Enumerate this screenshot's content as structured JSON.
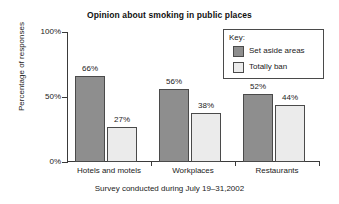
{
  "chart_data": {
    "type": "bar",
    "title": "Opinion about smoking in public places",
    "xlabel": "",
    "ylabel": "Percentage of responses",
    "caption": "Survey conducted during July 19–31,2002",
    "categories": [
      "Hotels and motels",
      "Workplaces",
      "Restaurants"
    ],
    "series": [
      {
        "name": "Set aside areas",
        "values": [
          66,
          56,
          52
        ],
        "labels": [
          "66%",
          "56%",
          "52%"
        ],
        "color": "#8e8e8e"
      },
      {
        "name": "Totally ban",
        "values": [
          27,
          38,
          44
        ],
        "labels": [
          "27%",
          "38%",
          "44%"
        ],
        "color": "#ebebeb"
      }
    ],
    "ylim": [
      0,
      100
    ],
    "yticks": [
      0,
      50,
      100
    ],
    "ytick_labels": [
      "0%",
      "50%",
      "100%"
    ],
    "grid": false,
    "legend_position": "top-right"
  },
  "legend": {
    "title": "Key:",
    "entries": [
      {
        "label": "Set aside areas",
        "swatch": "dark"
      },
      {
        "label": "Totally ban",
        "swatch": "light"
      }
    ]
  }
}
